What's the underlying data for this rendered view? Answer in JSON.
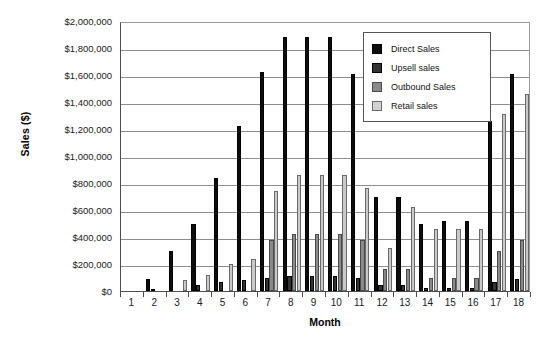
{
  "chart_data": {
    "type": "bar",
    "title": "",
    "xlabel": "Month",
    "ylabel": "Sales ($)",
    "ylim": [
      0,
      2000000
    ],
    "ytick_step": 200000,
    "ytick_labels": [
      "$2,000,000",
      "$1,800,000",
      "$1,600,000",
      "$1,400,000",
      "$1,200,000",
      "$1,000,000",
      "$800,000",
      "$600,000",
      "$400,000",
      "$200,000",
      "$0"
    ],
    "ytick_values": [
      2000000,
      1800000,
      1600000,
      1400000,
      1200000,
      1000000,
      800000,
      600000,
      400000,
      200000,
      0
    ],
    "categories": [
      "1",
      "2",
      "3",
      "4",
      "5",
      "6",
      "7",
      "8",
      "9",
      "10",
      "11",
      "12",
      "13",
      "14",
      "15",
      "16",
      "17",
      "18"
    ],
    "grid": true,
    "legend_position": "top-right",
    "series": [
      {
        "name": "Direct Sales",
        "color": "#0d0d0d",
        "values": [
          0,
          90000,
          300000,
          500000,
          840000,
          1220000,
          1620000,
          1880000,
          1880000,
          1880000,
          1610000,
          700000,
          700000,
          500000,
          520000,
          520000,
          1260000,
          1610000
        ]
      },
      {
        "name": "Upsell sales",
        "color": "#333333",
        "values": [
          0,
          15000,
          0,
          45000,
          65000,
          85000,
          100000,
          110000,
          110000,
          110000,
          100000,
          45000,
          45000,
          20000,
          20000,
          20000,
          65000,
          90000
        ]
      },
      {
        "name": "Outbound Sales",
        "color": "#8a8a8a",
        "values": [
          0,
          0,
          0,
          0,
          0,
          0,
          380000,
          420000,
          420000,
          420000,
          380000,
          160000,
          160000,
          100000,
          100000,
          100000,
          300000,
          380000
        ]
      },
      {
        "name": "Retail sales",
        "color": "#c9c9c9",
        "values": [
          0,
          0,
          80000,
          120000,
          200000,
          240000,
          740000,
          860000,
          860000,
          860000,
          760000,
          320000,
          620000,
          460000,
          460000,
          460000,
          1310000,
          1460000
        ]
      }
    ]
  },
  "legend": {
    "items": [
      {
        "label": "Direct Sales"
      },
      {
        "label": "Upsell sales"
      },
      {
        "label": "Outbound Sales"
      },
      {
        "label": "Retail sales"
      }
    ]
  }
}
